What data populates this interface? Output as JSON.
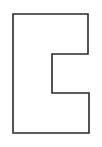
{
  "figure": {
    "width": 102,
    "height": 147,
    "background": "#ffffff",
    "stroke": "#2a2a2a",
    "stroke_width": 1.6,
    "shape": "C-shaped bracket outline",
    "points": "13,14 88,14 88,54 52,54 52,93 89,93 89,133 13,133"
  }
}
